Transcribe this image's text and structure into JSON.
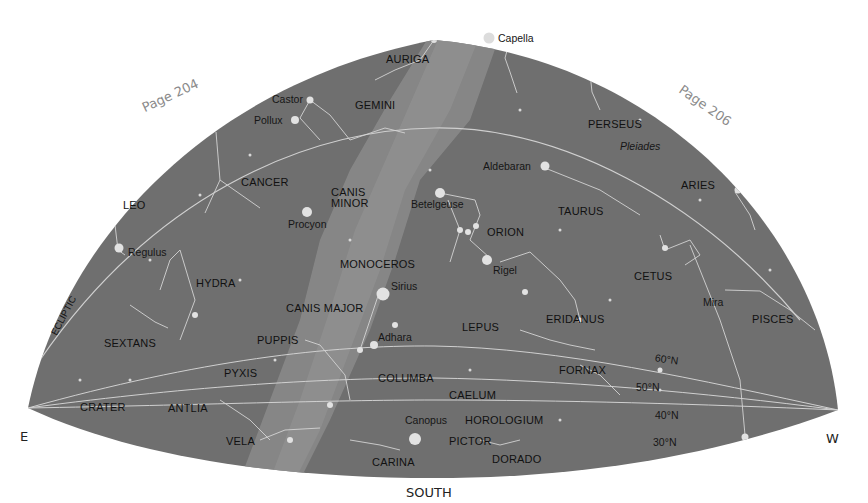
{
  "map": {
    "title_direction": "SOUTH",
    "directions": {
      "east": "E",
      "west": "W",
      "south": "SOUTH"
    },
    "page_refs": {
      "left": "Page 204",
      "right": "Page 206"
    },
    "ecliptic_label": "ECLIPTIC",
    "latitude_lines": [
      "60°N",
      "50°N",
      "40°N",
      "30°N"
    ],
    "colors": {
      "sky": "#6f6f6f",
      "milky_way": "#8a8a8a",
      "lines": "#d8d8d8",
      "stars": "#e2e2e2",
      "labels": "#111111",
      "page_ref": "#8a8a8a"
    },
    "constellations": {
      "auriga": "AURIGA",
      "gemini": "GEMINI",
      "perseus": "PERSEUS",
      "cancer": "CANCER",
      "canis_minor_1": "CANIS",
      "canis_minor_2": "MINOR",
      "leo": "LEO",
      "taurus": "TAURUS",
      "aries": "ARIES",
      "orion": "ORION",
      "hydra": "HYDRA",
      "monoceros": "MONOCEROS",
      "cetus": "CETUS",
      "canis_major": "CANIS MAJOR",
      "sextans": "SEXTANS",
      "puppis": "PUPPIS",
      "lepus": "LEPUS",
      "eridanus": "ERIDANUS",
      "pisces": "PISCES",
      "pyxis": "PYXIS",
      "columba": "COLUMBA",
      "fornax": "FORNAX",
      "caelum": "CAELUM",
      "crater": "CRATER",
      "antlia": "ANTLIA",
      "horologium": "HOROLOGIUM",
      "vela": "VELA",
      "pictor": "PICTOR",
      "carina": "CARINA",
      "dorado": "DORADO"
    },
    "stars": {
      "capella": "Capella",
      "castor": "Castor",
      "pollux": "Pollux",
      "pleiades": "Pleiades",
      "aldebaran": "Aldebaran",
      "betelgeuse": "Betelgeuse",
      "procyon": "Procyon",
      "regulus": "Regulus",
      "rigel": "Rigel",
      "sirius": "Sirius",
      "mira": "Mira",
      "adhara": "Adhara",
      "canopus": "Canopus"
    }
  }
}
